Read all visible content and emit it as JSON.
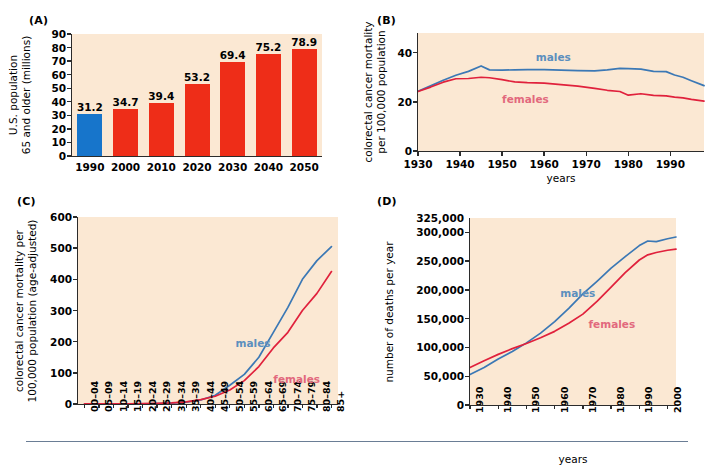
{
  "figure": {
    "panels": [
      "(A)",
      "(B)",
      "(C)",
      "(D)"
    ],
    "series_labels": {
      "males": "males",
      "females": "females"
    },
    "colors": {
      "male_line": "#3b78b5",
      "female_line": "#e0213c",
      "bar_red": "#ee2d18",
      "bar_blue": "#1775cb",
      "plot_bg": "#fbe8d3"
    }
  },
  "chart_data": [
    {
      "panel": "(A)",
      "type": "bar",
      "title": "",
      "xlabel": "",
      "ylabel": "U.S. population 65 and older (millions)",
      "ylabel_lines": [
        "U.S. population",
        "65 and older (millions)"
      ],
      "categories": [
        "1990",
        "2000",
        "2010",
        "2020",
        "2030",
        "2040",
        "2050"
      ],
      "values": [
        31.2,
        34.7,
        39.4,
        53.2,
        69.4,
        75.2,
        78.9
      ],
      "data_labels": [
        "31.2",
        "34.7",
        "39.4",
        "53.2",
        "69.4",
        "75.2",
        "78.9"
      ],
      "bar_colors": [
        "#1775cb",
        "#ee2d18",
        "#ee2d18",
        "#ee2d18",
        "#ee2d18",
        "#ee2d18",
        "#ee2d18"
      ],
      "yticks": [
        0,
        10,
        20,
        30,
        40,
        50,
        60,
        70,
        80,
        90
      ],
      "ytick_labels": [
        "0",
        "10",
        "20",
        "30",
        "40",
        "50",
        "60",
        "70",
        "80",
        "90"
      ],
      "ylim": [
        0,
        90
      ],
      "grid": false,
      "legend": "none"
    },
    {
      "panel": "(B)",
      "type": "line",
      "title": "",
      "xlabel": "years",
      "ylabel": "colorectal cancer mortality per 100,000 population",
      "ylabel_lines": [
        "colorectal cancer mortality",
        "per 100,000 population"
      ],
      "xticks": [
        1930,
        1940,
        1950,
        1960,
        1970,
        1980,
        1990
      ],
      "xtick_labels": [
        "1930",
        "1940",
        "1950",
        "1960",
        "1970",
        "1980",
        "1990"
      ],
      "yticks": [
        0,
        20,
        40
      ],
      "ytick_labels": [
        "0",
        "20",
        "40"
      ],
      "xlim": [
        1930,
        1998
      ],
      "ylim": [
        0,
        48
      ],
      "grid": false,
      "legend": "inline",
      "series": [
        {
          "name": "males",
          "color": "#3b78b5",
          "x": [
            1930,
            1933,
            1936,
            1939,
            1942,
            1945,
            1947,
            1950,
            1953,
            1956,
            1960,
            1964,
            1968,
            1972,
            1975,
            1978,
            1980,
            1983,
            1986,
            1989,
            1991,
            1993,
            1995,
            1998
          ],
          "values": [
            24.3,
            26.5,
            28.8,
            30.8,
            32.4,
            34.6,
            33.0,
            32.9,
            33.0,
            33.1,
            33.1,
            32.9,
            32.7,
            32.6,
            33.0,
            33.6,
            33.5,
            33.3,
            32.4,
            32.3,
            30.9,
            30.0,
            28.6,
            26.6
          ]
        },
        {
          "name": "females",
          "color": "#e0213c",
          "x": [
            1930,
            1933,
            1936,
            1939,
            1942,
            1945,
            1947,
            1950,
            1953,
            1956,
            1960,
            1964,
            1968,
            1972,
            1975,
            1978,
            1980,
            1983,
            1986,
            1989,
            1991,
            1993,
            1995,
            1998
          ],
          "values": [
            24.2,
            26.0,
            28.0,
            29.4,
            29.5,
            30.0,
            29.8,
            29.0,
            28.1,
            27.8,
            27.6,
            27.0,
            26.4,
            25.5,
            24.7,
            24.2,
            22.7,
            23.3,
            22.6,
            22.4,
            21.9,
            21.6,
            21.0,
            20.3
          ]
        }
      ]
    },
    {
      "panel": "(C)",
      "type": "line",
      "title": "",
      "xlabel": "",
      "ylabel": "colorectal cancer mortality per 100,000 population (age-adjusted)",
      "ylabel_lines": [
        "colorectal cancer mortality per",
        "100,000 population (age-adjusted)"
      ],
      "categories": [
        "00–04",
        "05–09",
        "10–14",
        "15–19",
        "20–24",
        "25–29",
        "30–34",
        "35–39",
        "40–44",
        "45–49",
        "50–54",
        "55–59",
        "60–64",
        "65–69",
        "70–74",
        "75–79",
        "80–84",
        "85+"
      ],
      "yticks": [
        0,
        100,
        200,
        300,
        400,
        500,
        600
      ],
      "ytick_labels": [
        "0",
        "100",
        "200",
        "300",
        "400",
        "500",
        "600"
      ],
      "ylim": [
        0,
        600
      ],
      "grid": false,
      "legend": "inline",
      "series": [
        {
          "name": "males",
          "color": "#3b78b5",
          "values": [
            0.2,
            0.2,
            0.3,
            0.5,
            0.8,
            1.5,
            3,
            6,
            13,
            28,
            60,
            95,
            150,
            230,
            310,
            400,
            460,
            505
          ]
        },
        {
          "name": "females",
          "color": "#e0213c",
          "values": [
            0.2,
            0.2,
            0.3,
            0.5,
            0.9,
            1.8,
            3.5,
            7,
            14,
            25,
            45,
            75,
            120,
            180,
            230,
            300,
            355,
            425
          ]
        }
      ]
    },
    {
      "panel": "(D)",
      "type": "line",
      "title": "",
      "xlabel": "years",
      "ylabel": "number of deaths per year",
      "ylabel_lines": [
        "number of deaths per year"
      ],
      "xticks": [
        1930,
        1940,
        1950,
        1960,
        1970,
        1980,
        1990,
        2000
      ],
      "xtick_labels": [
        "1930",
        "1940",
        "1950",
        "1960",
        "1970",
        "1980",
        "1990",
        "2000"
      ],
      "yticks": [
        0,
        50000,
        100000,
        150000,
        200000,
        250000,
        300000,
        325000
      ],
      "ytick_labels": [
        "0",
        "50,000",
        "100,000",
        "150,000",
        "200,000",
        "250,000",
        "300,000",
        "325,000"
      ],
      "xlim": [
        1930,
        2003
      ],
      "ylim": [
        0,
        325000
      ],
      "grid": false,
      "legend": "inline",
      "series": [
        {
          "name": "males",
          "color": "#3b78b5",
          "x": [
            1930,
            1935,
            1940,
            1945,
            1950,
            1955,
            1960,
            1965,
            1970,
            1975,
            1980,
            1985,
            1990,
            1993,
            1996,
            2000,
            2003
          ],
          "values": [
            53000,
            65000,
            80000,
            93000,
            108000,
            125000,
            145000,
            168000,
            193000,
            215000,
            238000,
            258000,
            277000,
            285000,
            284000,
            289000,
            292000
          ]
        },
        {
          "name": "females",
          "color": "#e0213c",
          "x": [
            1930,
            1935,
            1940,
            1945,
            1950,
            1955,
            1960,
            1965,
            1970,
            1975,
            1980,
            1985,
            1990,
            1993,
            1996,
            2000,
            2003
          ],
          "values": [
            65000,
            77000,
            88000,
            98000,
            107000,
            117000,
            128000,
            142000,
            158000,
            180000,
            205000,
            230000,
            252000,
            261000,
            265000,
            269000,
            271000
          ]
        }
      ]
    }
  ]
}
